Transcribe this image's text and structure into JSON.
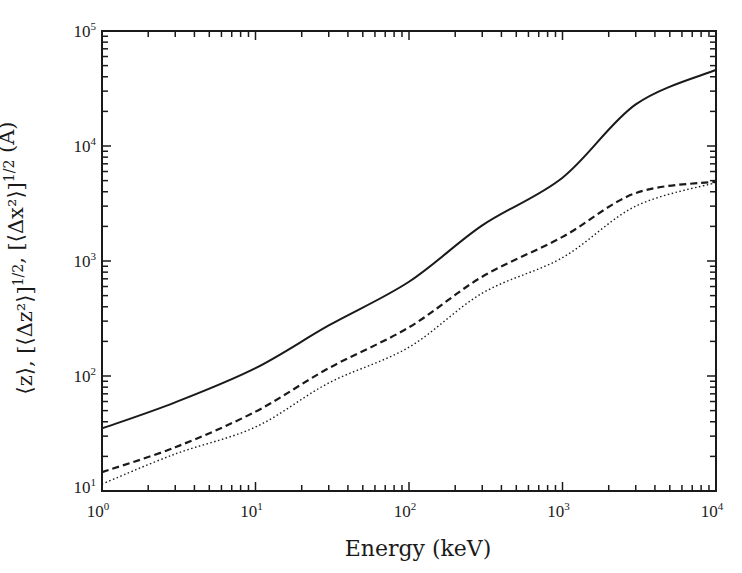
{
  "chart_data": {
    "type": "line",
    "title": "",
    "xlabel": "Energy (keV)",
    "ylabel": "⟨z⟩, [⟨Δz²⟩]^1/2, [⟨Δx²⟩]^1/2 (Å)",
    "xscale": "log",
    "yscale": "log",
    "xlim": [
      1,
      10000
    ],
    "ylim": [
      10,
      100000
    ],
    "grid": false,
    "legend": "none",
    "x_ticks": [
      {
        "base": "10",
        "exp": "0",
        "value": 1
      },
      {
        "base": "10",
        "exp": "1",
        "value": 10
      },
      {
        "base": "10",
        "exp": "2",
        "value": 100
      },
      {
        "base": "10",
        "exp": "3",
        "value": 1000
      },
      {
        "base": "10",
        "exp": "4",
        "value": 10000
      }
    ],
    "y_ticks": [
      {
        "base": "10",
        "exp": "1",
        "value": 10
      },
      {
        "base": "10",
        "exp": "2",
        "value": 100
      },
      {
        "base": "10",
        "exp": "3",
        "value": 1000
      },
      {
        "base": "10",
        "exp": "4",
        "value": 10000
      },
      {
        "base": "10",
        "exp": "5",
        "value": 100000
      }
    ],
    "x": [
      1,
      3,
      10,
      30,
      100,
      300,
      1000,
      3000,
      10000
    ],
    "series": [
      {
        "name": "⟨z⟩",
        "style": "solid",
        "values": [
          35,
          59,
          117,
          275,
          660,
          2040,
          5300,
          23000,
          46000
        ]
      },
      {
        "name": "[⟨Δz²⟩]^1/2",
        "style": "dashed",
        "values": [
          14.6,
          24,
          49,
          117,
          265,
          730,
          1620,
          3900,
          4900
        ]
      },
      {
        "name": "[⟨Δx²⟩]^1/2",
        "style": "dotted",
        "values": [
          11.5,
          21,
          36,
          87,
          178,
          525,
          1070,
          3000,
          4800
        ]
      }
    ]
  }
}
